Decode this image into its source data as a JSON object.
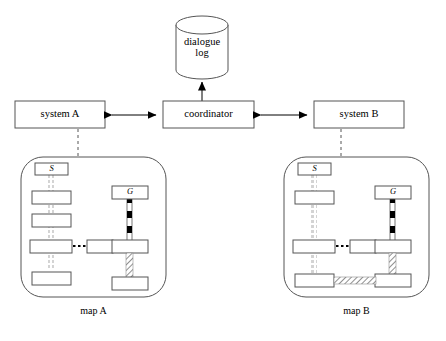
{
  "diagram": {
    "colors": {
      "stroke": "#555555",
      "stroke_dark": "#000000",
      "fill": "#ffffff",
      "marker_fill": "#000000",
      "hatch": "#9a9a9a",
      "background": "#ffffff"
    }
  },
  "store": {
    "label_line1": "dialogue",
    "label_line2": "log",
    "shape": "cylinder-database"
  },
  "nodes": {
    "coordinator": {
      "label": "coordinator"
    },
    "system_a": {
      "label": "system A"
    },
    "system_b": {
      "label": "system B"
    }
  },
  "arrows": {
    "coordinator_to_log": {
      "name": "log-arrow",
      "direction": "up",
      "heads": 1
    },
    "system_a_coordinator": {
      "name": "system-a-link",
      "direction": "both",
      "heads": 2
    },
    "system_b_coordinator": {
      "name": "system-b-link",
      "direction": "both",
      "heads": 2
    }
  },
  "maps": [
    {
      "id": "map-a",
      "caption": "map A",
      "start_label": "S",
      "goal_label": "G",
      "left_column_box_count": 5,
      "goal_column_marker_count": 3,
      "bottom_horizontal_link": "none"
    },
    {
      "id": "map-b",
      "caption": "map B",
      "start_label": "S",
      "goal_label": "G",
      "left_column_box_count": 4,
      "goal_column_marker_count": 3,
      "bottom_horizontal_link": "hatched"
    }
  ]
}
